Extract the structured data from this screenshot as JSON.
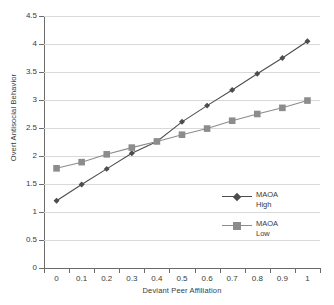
{
  "chart_data": {
    "type": "line",
    "title": "",
    "xlabel": "Deviant Peer Affiliation",
    "ylabel": "Overt Antisocial Behavior",
    "x": [
      0,
      0.1,
      0.2,
      0.3,
      0.4,
      0.5,
      0.6,
      0.7,
      0.8,
      0.9,
      1
    ],
    "categories": [
      "0",
      "0.1",
      "0.2",
      "0.3",
      "0.4",
      "0.5",
      "0.6",
      "0.7",
      "0.8",
      "0.9",
      "1"
    ],
    "series": [
      {
        "name": "MAOA High",
        "name_line1": "MAOA",
        "name_line2": "High",
        "marker": "diamond",
        "color": "#4d4d4d",
        "values": [
          1.2,
          1.49,
          1.77,
          2.05,
          2.26,
          2.61,
          2.9,
          3.18,
          3.47,
          3.75,
          4.05
        ]
      },
      {
        "name": "MAOA Low",
        "name_line1": "MAOA",
        "name_line2": "Low",
        "marker": "square",
        "color": "#8c8c8c",
        "values": [
          1.78,
          1.89,
          2.03,
          2.15,
          2.26,
          2.38,
          2.49,
          2.63,
          2.75,
          2.86,
          2.99
        ]
      }
    ],
    "ylim": [
      0,
      4.5
    ],
    "yticks": [
      0,
      0.5,
      1,
      1.5,
      2,
      2.5,
      3,
      3.5,
      4,
      4.5
    ],
    "ytick_labels": [
      "0",
      "0.5",
      "1",
      "1.5",
      "2",
      "2.5",
      "3",
      "3.5",
      "4",
      "4.5"
    ],
    "grid": true,
    "grid_axis": "y",
    "legend_position": "inside-lower-right",
    "axis_color": "#6b6b6b",
    "grid_color": "#d9d9d9"
  }
}
